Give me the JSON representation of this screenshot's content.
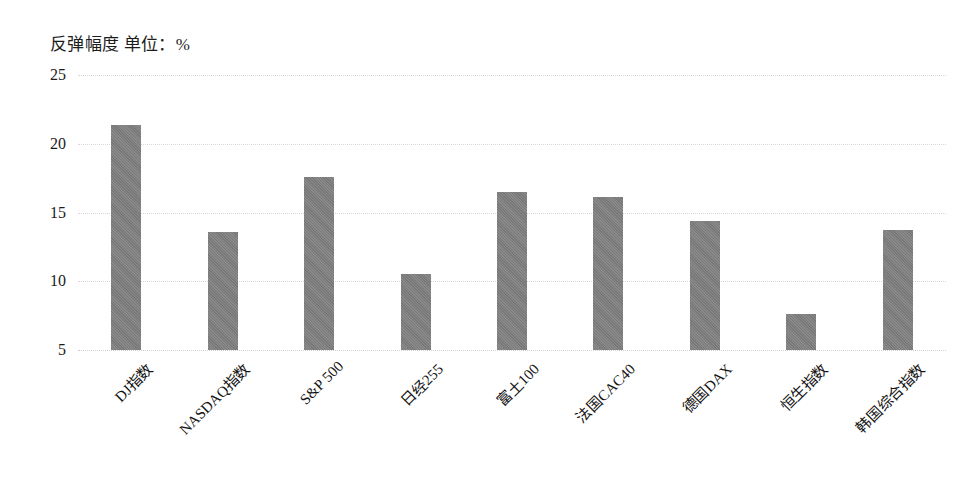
{
  "chart_data": {
    "type": "bar",
    "title": "反弹幅度 单位：%",
    "xlabel": "",
    "ylabel": "",
    "ylim": [
      5,
      25
    ],
    "yticks": [
      25,
      20,
      15,
      10,
      5
    ],
    "ytick_labels": [
      "25",
      "20",
      "15",
      "10",
      "5"
    ],
    "grid": true,
    "legend": false,
    "legend_position": "none",
    "bar_color": "#7f7f7f",
    "background_color": "#ffffff",
    "categories": [
      "DJ指数",
      "NASDAQ指数",
      "S&P 500",
      "日经255",
      "富土100",
      "法国CAC40",
      "德国DAX",
      "恒生指数",
      "韩国综合指数"
    ],
    "values": [
      21.4,
      13.6,
      17.6,
      10.5,
      16.5,
      16.1,
      14.4,
      7.6,
      13.7
    ],
    "series": [
      {
        "name": "反弹幅度",
        "values": [
          21.4,
          13.6,
          17.6,
          10.5,
          16.5,
          16.1,
          14.4,
          7.6,
          13.7
        ]
      }
    ]
  }
}
